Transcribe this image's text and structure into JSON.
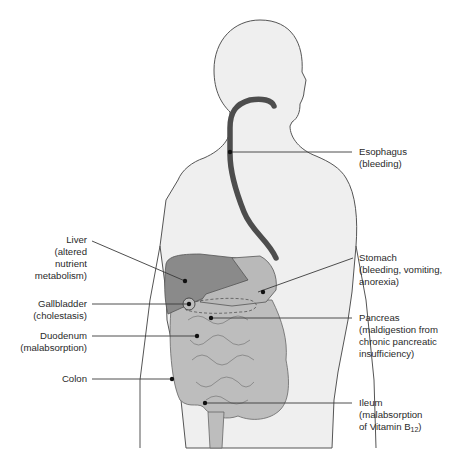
{
  "diagram": {
    "type": "anatomical-illustration",
    "colors": {
      "body_fill": "#efefef",
      "body_outline": "#555555",
      "esophagus": "#4d4d4d",
      "liver": "#8a8a8a",
      "stomach": "#b9b9b9",
      "intestine": "#bdbdbd",
      "leader_line": "#3a3a3a",
      "text": "#2a2a2a"
    }
  },
  "labels": {
    "esophagus": {
      "name": "Esophagus",
      "detail": [
        "(bleeding)"
      ]
    },
    "liver": {
      "name": "Liver",
      "detail": [
        "(altered",
        "nutrient",
        "metabolism)"
      ]
    },
    "stomach": {
      "name": "Stomach",
      "detail": [
        "(bleeding, vomiting,",
        "anorexia)"
      ]
    },
    "gallbladder": {
      "name": "Gallbladder",
      "detail": [
        "(cholestasis)"
      ]
    },
    "pancreas": {
      "name": "Pancreas",
      "detail": [
        "(maldigestion from",
        "chronic pancreatic",
        "insufficiency)"
      ]
    },
    "duodenum": {
      "name": "Duodenum",
      "detail": [
        "(malabsorption)"
      ]
    },
    "colon": {
      "name": "Colon",
      "detail": []
    },
    "ileum": {
      "name": "Ileum",
      "detail": [
        "(malabsorption",
        "of Vitamin B"
      ],
      "subscript": "12",
      "suffix": ")"
    }
  }
}
